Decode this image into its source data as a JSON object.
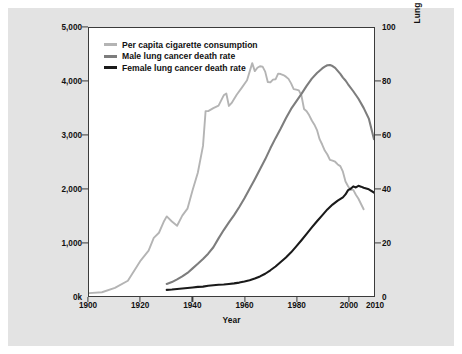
{
  "figure": {
    "background_color": "#e3e3e3",
    "plot_background_color": "#ffffff",
    "border_color": "#3b3b3b"
  },
  "legend": {
    "position": "top-left-inside",
    "items": [
      {
        "label": "Per capita cigarette consumption",
        "color": "#b4b4b4",
        "axis": "left"
      },
      {
        "label": "Male lung cancer death rate",
        "color": "#7d7d7d",
        "axis": "right"
      },
      {
        "label": "Female lung cancer death rate",
        "color": "#1a1a1a",
        "axis": "right"
      }
    ]
  },
  "axes": {
    "x": {
      "label": "Year",
      "ticks": [
        1900,
        1920,
        1940,
        1960,
        1980,
        2000,
        2010
      ],
      "tick_labels": [
        "1900",
        "1920",
        "1940",
        "1960",
        "1980",
        "2000",
        "2010"
      ],
      "min": 1900,
      "max": 2010
    },
    "y_left": {
      "label": "Per capita cigarette consumption (age 18 and up)",
      "ticks": [
        0,
        1000,
        2000,
        3000,
        4000,
        5000
      ],
      "tick_labels": [
        "0k",
        "1,000",
        "2,000",
        "3,000",
        "4,000",
        "5,000"
      ],
      "min": 0,
      "max": 5000
    },
    "y_right": {
      "label": "Lung cancer deaths per 100,000 people (age-adjusted to 2,000 U.S. standard population)",
      "ticks": [
        0,
        20,
        40,
        60,
        80,
        100
      ],
      "tick_labels": [
        "0",
        "20",
        "40",
        "60",
        "80",
        "100"
      ],
      "min": 0,
      "max": 100
    }
  },
  "chart_data": {
    "type": "line",
    "title": "",
    "xlabel": "Year",
    "ylabel": "Per capita cigarette consumption (age 18 and up)",
    "ylabel_secondary": "Lung cancer deaths per 100,000 people (age-adjusted to 2,000 U.S. standard population)",
    "xlim": [
      1900,
      2010
    ],
    "ylim": [
      0,
      5000
    ],
    "ylim_secondary": [
      0,
      100
    ],
    "grid": false,
    "legend_position": "upper left",
    "series": [
      {
        "name": "Per capita cigarette consumption",
        "color": "#b4b4b4",
        "axis": "left",
        "units": "cigarettes per capita (age 18 and up)",
        "x": [
          1900,
          1905,
          1910,
          1915,
          1920,
          1923,
          1925,
          1927,
          1929,
          1930,
          1932,
          1934,
          1936,
          1938,
          1940,
          1942,
          1944,
          1945,
          1946,
          1948,
          1950,
          1952,
          1953,
          1954,
          1955,
          1957,
          1959,
          1961,
          1963,
          1964,
          1965,
          1966,
          1967,
          1968,
          1969,
          1970,
          1971,
          1972,
          1973,
          1974,
          1975,
          1976,
          1977,
          1978,
          1979,
          1980,
          1981,
          1982,
          1983,
          1984,
          1985,
          1986,
          1987,
          1988,
          1989,
          1990,
          1991,
          1992,
          1993,
          1994,
          1995,
          1996,
          1997,
          1998,
          1999,
          2000,
          2001,
          2002,
          2003,
          2004,
          2005,
          2006
        ],
        "y": [
          54,
          70,
          151,
          285,
          665,
          845,
          1085,
          1180,
          1400,
          1485,
          1390,
          1310,
          1500,
          1630,
          1976,
          2300,
          2800,
          3450,
          3450,
          3505,
          3552,
          3744,
          3778,
          3546,
          3597,
          3755,
          3888,
          4025,
          4345,
          4195,
          4258,
          4287,
          4280,
          4186,
          3993,
          3985,
          4037,
          4043,
          4148,
          4141,
          4123,
          4092,
          4051,
          3967,
          3861,
          3849,
          3836,
          3739,
          3488,
          3446,
          3370,
          3274,
          3197,
          3096,
          2926,
          2826,
          2713,
          2640,
          2539,
          2524,
          2505,
          2455,
          2423,
          2320,
          2136,
          2049,
          1979,
          1979,
          1890,
          1814,
          1716,
          1619
        ]
      },
      {
        "name": "Male lung cancer death rate",
        "color": "#7d7d7d",
        "axis": "right",
        "units": "deaths per 100,000",
        "x": [
          1930,
          1932,
          1934,
          1936,
          1938,
          1940,
          1942,
          1944,
          1946,
          1948,
          1950,
          1952,
          1954,
          1956,
          1958,
          1960,
          1962,
          1964,
          1966,
          1968,
          1970,
          1972,
          1974,
          1976,
          1978,
          1980,
          1982,
          1984,
          1986,
          1988,
          1990,
          1991,
          1992,
          1993,
          1994,
          1995,
          1996,
          1997,
          1998,
          1999,
          2000,
          2002,
          2004,
          2006,
          2008,
          2010
        ],
        "y": [
          4.5,
          5.2,
          6.2,
          7.3,
          8.6,
          10.3,
          12.0,
          13.8,
          15.8,
          18.2,
          21.5,
          24.6,
          27.5,
          30.2,
          33.2,
          36.5,
          40.0,
          43.6,
          47.3,
          51.0,
          55.1,
          58.9,
          62.5,
          66.3,
          69.8,
          72.6,
          75.4,
          78.4,
          81.1,
          83.2,
          84.9,
          85.6,
          86.1,
          86.2,
          85.8,
          85.1,
          84.0,
          82.9,
          81.5,
          80.4,
          79.0,
          76.4,
          73.6,
          70.2,
          66.2,
          58.5
        ]
      },
      {
        "name": "Female lung cancer death rate",
        "color": "#1a1a1a",
        "axis": "right",
        "units": "deaths per 100,000",
        "x": [
          1930,
          1932,
          1934,
          1936,
          1938,
          1940,
          1942,
          1944,
          1946,
          1948,
          1950,
          1952,
          1954,
          1956,
          1958,
          1960,
          1962,
          1964,
          1966,
          1968,
          1970,
          1972,
          1974,
          1976,
          1978,
          1980,
          1982,
          1984,
          1986,
          1988,
          1990,
          1992,
          1994,
          1996,
          1998,
          1999,
          2000,
          2001,
          2002,
          2003,
          2004,
          2005,
          2006,
          2008,
          2010
        ],
        "y": [
          2.3,
          2.4,
          2.6,
          2.8,
          3.0,
          3.2,
          3.4,
          3.5,
          3.8,
          4.0,
          4.2,
          4.3,
          4.5,
          4.7,
          5.0,
          5.4,
          5.9,
          6.5,
          7.3,
          8.3,
          9.6,
          11.0,
          12.7,
          14.4,
          16.3,
          18.5,
          20.8,
          23.2,
          25.6,
          27.9,
          30.1,
          32.3,
          34.1,
          35.6,
          36.8,
          37.9,
          39.5,
          40.0,
          40.9,
          40.5,
          41.1,
          40.8,
          40.4,
          39.8,
          38.6
        ]
      }
    ]
  }
}
